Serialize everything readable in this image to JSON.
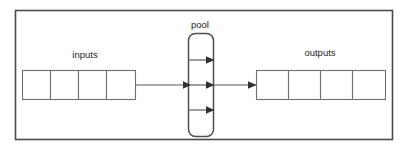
{
  "figure": {
    "background_color": "#ffffff",
    "frame": {
      "stroke_color": "#4a4a4a"
    }
  },
  "labels": {
    "inputs": "inputs",
    "pool": "pool",
    "outputs": "outputs"
  },
  "inputs_group": {
    "label": "inputs",
    "cell_count": 4,
    "cells": [
      {
        "value": ""
      },
      {
        "value": ""
      },
      {
        "value": ""
      },
      {
        "value": ""
      }
    ]
  },
  "pool_group": {
    "label": "pool",
    "shape": "rounded-rectangle",
    "internal_arrow_count": 3,
    "arrows": [
      {
        "position": "top",
        "direction": "right"
      },
      {
        "position": "middle",
        "direction": "right"
      },
      {
        "position": "bottom",
        "direction": "right"
      }
    ]
  },
  "outputs_group": {
    "label": "outputs",
    "cell_count": 4,
    "cells": [
      {
        "value": ""
      },
      {
        "value": ""
      },
      {
        "value": ""
      },
      {
        "value": ""
      }
    ]
  },
  "connectors": [
    {
      "from": "inputs",
      "to": "pool",
      "direction": "right"
    },
    {
      "from": "pool",
      "to": "outputs",
      "direction": "right"
    }
  ],
  "colors": {
    "frame_stroke": "#4a4a4a",
    "cell_stroke": "#6e6e6e",
    "pool_stroke": "#4f4f4f",
    "line_stroke": "#585858",
    "arrow_fill": "#303030",
    "text": "#1d1d1d"
  }
}
